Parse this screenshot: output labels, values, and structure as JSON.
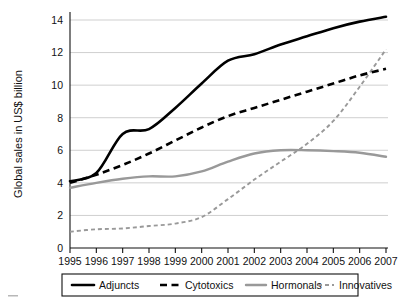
{
  "chart_data": {
    "type": "line",
    "title": "",
    "xlabel": "",
    "ylabel": "Global sales in US$ billion",
    "x": [
      1995,
      1996,
      1997,
      1998,
      1999,
      2000,
      2001,
      2002,
      2003,
      2004,
      2005,
      2006,
      2007
    ],
    "categories": [
      "1995",
      "1996",
      "1997",
      "1998",
      "1999",
      "2000",
      "2001",
      "2002",
      "2003",
      "2004",
      "2005",
      "2006",
      "2007"
    ],
    "xlim": [
      1995,
      2007
    ],
    "ylim": [
      0,
      14
    ],
    "yticks": [
      0,
      2,
      4,
      6,
      8,
      10,
      12,
      14
    ],
    "ytick_labels": [
      "0",
      "2",
      "4",
      "6",
      "8",
      "10",
      "12",
      "14"
    ],
    "grid": "horizontal",
    "legend_position": "bottom",
    "series": [
      {
        "name": "Adjuncts",
        "style": "solid",
        "color": "#000000",
        "values": [
          4.1,
          4.6,
          7.0,
          7.3,
          8.6,
          10.1,
          11.5,
          11.9,
          12.5,
          13.0,
          13.5,
          13.9,
          14.2
        ]
      },
      {
        "name": "Cytotoxics",
        "style": "dashed",
        "color": "#000000",
        "values": [
          4.0,
          4.5,
          5.1,
          5.8,
          6.6,
          7.4,
          8.1,
          8.6,
          9.1,
          9.6,
          10.1,
          10.6,
          11.0
        ]
      },
      {
        "name": "Hormonals",
        "style": "solid",
        "color": "#999999",
        "values": [
          3.7,
          4.0,
          4.25,
          4.4,
          4.4,
          4.7,
          5.3,
          5.8,
          6.0,
          6.0,
          5.95,
          5.85,
          5.6
        ]
      },
      {
        "name": "Innovatives",
        "style": "dotted",
        "color": "#999999",
        "values": [
          1.0,
          1.15,
          1.2,
          1.35,
          1.5,
          1.9,
          3.0,
          4.2,
          5.3,
          6.4,
          7.8,
          9.9,
          12.2
        ]
      }
    ]
  },
  "legend": {
    "items": [
      {
        "label": "Adjuncts"
      },
      {
        "label": "Cytotoxics"
      },
      {
        "label": "Hormonals"
      },
      {
        "label": "Innovatives"
      }
    ]
  }
}
